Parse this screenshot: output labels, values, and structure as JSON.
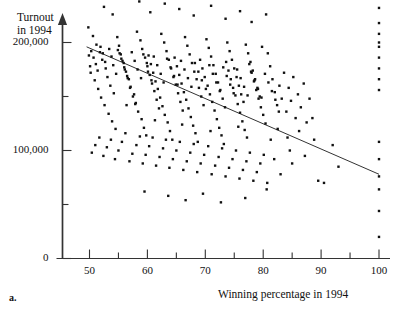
{
  "chart_data": {
    "type": "scatter",
    "title": "",
    "panel_label": "a.",
    "xlabel": "Winning percentage in 1994",
    "ylabel": "Turnout in 1994",
    "ylabel_lines": [
      "Turnout",
      "in 1994"
    ],
    "xlim": [
      45,
      102
    ],
    "ylim": [
      -12000,
      340000
    ],
    "grid": false,
    "legend": null,
    "x_ticks_major": [
      50,
      60,
      70,
      80,
      90,
      100
    ],
    "x_ticks_major_labels": [
      "50",
      "60",
      "70",
      "80",
      "90",
      "100"
    ],
    "x_ticks_minor": [
      55,
      65,
      75,
      85,
      95
    ],
    "y_ticks_major": [
      0,
      100000,
      200000,
      300000
    ],
    "y_ticks_major_labels": [
      "0",
      "100,000",
      "200,000",
      "300,000"
    ],
    "y_ticks_minor": [
      50000,
      150000,
      250000,
      350000
    ],
    "marker": "filled-square-dot",
    "marker_color": "#111111",
    "marker_size_px": 2.4,
    "axis_color": "#333333",
    "trendline": {
      "name": "least-squares regression line",
      "color": "#333333",
      "x_start": 49.5,
      "y_start": 196000,
      "x_end": 100.0,
      "y_end": 78000
    },
    "points": [
      [
        57.2,
        318000
      ],
      [
        70.0,
        295000
      ],
      [
        56.0,
        255000
      ],
      [
        52.5,
        233000
      ],
      [
        54.0,
        226000
      ],
      [
        58.6,
        238000
      ],
      [
        60.5,
        228000
      ],
      [
        63.0,
        236000
      ],
      [
        65.5,
        231000
      ],
      [
        68.0,
        225000
      ],
      [
        71.0,
        234000
      ],
      [
        73.5,
        222000
      ],
      [
        76.0,
        229000
      ],
      [
        78.0,
        219000
      ],
      [
        80.5,
        226000
      ],
      [
        49.8,
        214000
      ],
      [
        50.6,
        206000
      ],
      [
        51.2,
        198000
      ],
      [
        51.8,
        191000
      ],
      [
        52.2,
        184000
      ],
      [
        52.8,
        176000
      ],
      [
        53.1,
        168000
      ],
      [
        53.6,
        160000
      ],
      [
        54.2,
        153000
      ],
      [
        54.8,
        205000
      ],
      [
        55.1,
        197000
      ],
      [
        55.4,
        189000
      ],
      [
        55.9,
        181000
      ],
      [
        56.3,
        173000
      ],
      [
        56.8,
        166000
      ],
      [
        57.0,
        158000
      ],
      [
        57.5,
        150000
      ],
      [
        57.9,
        143000
      ],
      [
        58.2,
        210000
      ],
      [
        58.8,
        202000
      ],
      [
        59.1,
        194000
      ],
      [
        59.6,
        186000
      ],
      [
        60.0,
        178000
      ],
      [
        60.4,
        170000
      ],
      [
        60.8,
        162000
      ],
      [
        61.2,
        155000
      ],
      [
        61.6,
        147000
      ],
      [
        62.0,
        139000
      ],
      [
        62.4,
        208000
      ],
      [
        62.9,
        200000
      ],
      [
        63.3,
        192000
      ],
      [
        63.7,
        184000
      ],
      [
        64.1,
        176000
      ],
      [
        64.5,
        168000
      ],
      [
        64.9,
        161000
      ],
      [
        65.3,
        153000
      ],
      [
        65.7,
        145000
      ],
      [
        66.1,
        137000
      ],
      [
        66.5,
        205000
      ],
      [
        66.9,
        197000
      ],
      [
        67.3,
        189000
      ],
      [
        67.7,
        181000
      ],
      [
        68.1,
        173000
      ],
      [
        68.5,
        166000
      ],
      [
        68.9,
        158000
      ],
      [
        69.3,
        150000
      ],
      [
        69.7,
        142000
      ],
      [
        70.2,
        203000
      ],
      [
        70.6,
        195000
      ],
      [
        71.0,
        187000
      ],
      [
        71.4,
        179000
      ],
      [
        71.8,
        171000
      ],
      [
        72.2,
        163000
      ],
      [
        72.6,
        156000
      ],
      [
        73.0,
        148000
      ],
      [
        73.4,
        140000
      ],
      [
        73.8,
        200000
      ],
      [
        74.2,
        192000
      ],
      [
        74.6,
        184000
      ],
      [
        75.0,
        176000
      ],
      [
        75.4,
        168000
      ],
      [
        75.8,
        160000
      ],
      [
        76.2,
        152000
      ],
      [
        76.6,
        145000
      ],
      [
        77.0,
        198000
      ],
      [
        77.4,
        190000
      ],
      [
        77.8,
        182000
      ],
      [
        78.2,
        174000
      ],
      [
        78.6,
        166000
      ],
      [
        79.0,
        158000
      ],
      [
        79.4,
        150000
      ],
      [
        79.8,
        196000
      ],
      [
        50.2,
        172000
      ],
      [
        50.9,
        165000
      ],
      [
        51.5,
        157000
      ],
      [
        52.0,
        149000
      ],
      [
        52.6,
        142000
      ],
      [
        53.3,
        134000
      ],
      [
        53.9,
        127000
      ],
      [
        54.5,
        120000
      ],
      [
        55.2,
        190000
      ],
      [
        55.7,
        183000
      ],
      [
        56.1,
        175000
      ],
      [
        56.6,
        167000
      ],
      [
        57.1,
        159000
      ],
      [
        57.7,
        152000
      ],
      [
        58.0,
        144000
      ],
      [
        58.4,
        136000
      ],
      [
        59.0,
        129000
      ],
      [
        59.4,
        121000
      ],
      [
        59.8,
        114000
      ],
      [
        60.2,
        188000
      ],
      [
        60.6,
        180000
      ],
      [
        61.0,
        172000
      ],
      [
        61.4,
        164000
      ],
      [
        61.8,
        157000
      ],
      [
        62.2,
        149000
      ],
      [
        62.6,
        141000
      ],
      [
        63.0,
        133000
      ],
      [
        63.5,
        126000
      ],
      [
        63.9,
        118000
      ],
      [
        64.3,
        110000
      ],
      [
        64.7,
        186000
      ],
      [
        65.1,
        178000
      ],
      [
        65.5,
        170000
      ],
      [
        65.9,
        162000
      ],
      [
        66.3,
        154000
      ],
      [
        66.7,
        147000
      ],
      [
        67.1,
        139000
      ],
      [
        67.5,
        131000
      ],
      [
        67.9,
        123000
      ],
      [
        68.3,
        116000
      ],
      [
        68.7,
        108000
      ],
      [
        69.1,
        184000
      ],
      [
        69.5,
        176000
      ],
      [
        69.9,
        168000
      ],
      [
        70.4,
        160000
      ],
      [
        70.8,
        152000
      ],
      [
        71.2,
        145000
      ],
      [
        71.6,
        137000
      ],
      [
        72.0,
        129000
      ],
      [
        72.4,
        121000
      ],
      [
        72.8,
        114000
      ],
      [
        73.2,
        106000
      ],
      [
        73.6,
        182000
      ],
      [
        74.0,
        174000
      ],
      [
        74.4,
        166000
      ],
      [
        74.8,
        158000
      ],
      [
        75.2,
        151000
      ],
      [
        75.6,
        143000
      ],
      [
        76.0,
        135000
      ],
      [
        76.4,
        127000
      ],
      [
        76.8,
        119000
      ],
      [
        77.2,
        112000
      ],
      [
        77.6,
        180000
      ],
      [
        78.0,
        172000
      ],
      [
        78.4,
        164000
      ],
      [
        78.8,
        156000
      ],
      [
        79.2,
        148000
      ],
      [
        79.6,
        140000
      ],
      [
        80.0,
        133000
      ],
      [
        80.4,
        125000
      ],
      [
        80.8,
        190000
      ],
      [
        81.2,
        178000
      ],
      [
        81.6,
        166000
      ],
      [
        82.0,
        154000
      ],
      [
        82.4,
        142000
      ],
      [
        82.8,
        160000
      ],
      [
        83.2,
        148000
      ],
      [
        83.6,
        172000
      ],
      [
        84.0,
        136000
      ],
      [
        84.4,
        158000
      ],
      [
        84.8,
        146000
      ],
      [
        85.2,
        168000
      ],
      [
        85.6,
        130000
      ],
      [
        86.0,
        152000
      ],
      [
        86.5,
        140000
      ],
      [
        87.0,
        162000
      ],
      [
        87.5,
        126000
      ],
      [
        88.0,
        148000
      ],
      [
        50.4,
        98000
      ],
      [
        51.0,
        105000
      ],
      [
        51.7,
        112000
      ],
      [
        52.4,
        95000
      ],
      [
        53.0,
        103000
      ],
      [
        53.7,
        110000
      ],
      [
        54.4,
        92000
      ],
      [
        55.0,
        100000
      ],
      [
        55.6,
        108000
      ],
      [
        56.2,
        116000
      ],
      [
        56.9,
        90000
      ],
      [
        57.4,
        97000
      ],
      [
        58.1,
        105000
      ],
      [
        58.7,
        113000
      ],
      [
        59.2,
        88000
      ],
      [
        59.7,
        96000
      ],
      [
        60.3,
        104000
      ],
      [
        60.9,
        112000
      ],
      [
        61.5,
        86000
      ],
      [
        62.1,
        94000
      ],
      [
        62.7,
        102000
      ],
      [
        63.2,
        110000
      ],
      [
        63.8,
        84000
      ],
      [
        64.4,
        92000
      ],
      [
        65.0,
        100000
      ],
      [
        65.6,
        108000
      ],
      [
        66.2,
        82000
      ],
      [
        66.8,
        90000
      ],
      [
        67.4,
        98000
      ],
      [
        68.0,
        106000
      ],
      [
        68.6,
        80000
      ],
      [
        69.2,
        88000
      ],
      [
        69.8,
        96000
      ],
      [
        70.5,
        104000
      ],
      [
        71.1,
        78000
      ],
      [
        71.7,
        86000
      ],
      [
        72.3,
        94000
      ],
      [
        72.9,
        102000
      ],
      [
        73.5,
        76000
      ],
      [
        74.1,
        84000
      ],
      [
        74.7,
        92000
      ],
      [
        75.3,
        100000
      ],
      [
        75.9,
        74000
      ],
      [
        76.5,
        82000
      ],
      [
        77.1,
        90000
      ],
      [
        77.7,
        98000
      ],
      [
        78.3,
        72000
      ],
      [
        78.9,
        80000
      ],
      [
        79.5,
        88000
      ],
      [
        80.1,
        96000
      ],
      [
        80.7,
        70000
      ],
      [
        81.3,
        110000
      ],
      [
        81.9,
        92000
      ],
      [
        82.5,
        120000
      ],
      [
        83.0,
        78000
      ],
      [
        84.2,
        112000
      ],
      [
        85.0,
        88000
      ],
      [
        86.2,
        118000
      ],
      [
        87.2,
        95000
      ],
      [
        88.5,
        130000
      ],
      [
        89.5,
        72000
      ],
      [
        90.5,
        70000
      ],
      [
        92.0,
        105000
      ],
      [
        93.0,
        85000
      ],
      [
        49.9,
        188000
      ],
      [
        50.1,
        178000
      ],
      [
        50.3,
        192000
      ],
      [
        50.7,
        186000
      ],
      [
        51.1,
        180000
      ],
      [
        51.4,
        174000
      ],
      [
        51.9,
        196000
      ],
      [
        52.3,
        190000
      ],
      [
        52.7,
        182000
      ],
      [
        53.4,
        194000
      ],
      [
        53.8,
        187000
      ],
      [
        54.1,
        179000
      ],
      [
        54.6,
        171000
      ],
      [
        54.9,
        193000
      ],
      [
        55.5,
        185000
      ],
      [
        56.0,
        177000
      ],
      [
        56.5,
        169000
      ],
      [
        57.3,
        191000
      ],
      [
        57.8,
        183000
      ],
      [
        58.3,
        175000
      ],
      [
        58.9,
        167000
      ],
      [
        59.3,
        189000
      ],
      [
        59.9,
        181000
      ],
      [
        60.1,
        173000
      ],
      [
        60.7,
        165000
      ],
      [
        61.1,
        187000
      ],
      [
        61.7,
        179000
      ],
      [
        62.3,
        171000
      ],
      [
        62.8,
        163000
      ],
      [
        63.4,
        185000
      ],
      [
        64.0,
        177000
      ],
      [
        64.6,
        169000
      ],
      [
        65.2,
        161000
      ],
      [
        65.8,
        183000
      ],
      [
        66.4,
        175000
      ],
      [
        67.0,
        167000
      ],
      [
        67.6,
        159000
      ],
      [
        68.2,
        181000
      ],
      [
        68.8,
        173000
      ],
      [
        69.4,
        165000
      ],
      [
        70.1,
        157000
      ],
      [
        70.7,
        179000
      ],
      [
        71.3,
        171000
      ],
      [
        71.9,
        163000
      ],
      [
        72.5,
        155000
      ],
      [
        73.1,
        177000
      ],
      [
        73.7,
        169000
      ],
      [
        74.3,
        161000
      ],
      [
        74.9,
        153000
      ],
      [
        75.5,
        175000
      ],
      [
        76.1,
        167000
      ],
      [
        76.7,
        159000
      ],
      [
        77.3,
        151000
      ],
      [
        77.9,
        173000
      ],
      [
        78.5,
        165000
      ],
      [
        79.1,
        157000
      ],
      [
        79.7,
        149000
      ],
      [
        80.3,
        171000
      ],
      [
        80.9,
        163000
      ],
      [
        81.5,
        155000
      ],
      [
        82.1,
        147000
      ],
      [
        56.4,
        142000
      ],
      [
        61.3,
        128000
      ],
      [
        66.0,
        124000
      ],
      [
        70.9,
        118000
      ],
      [
        75.7,
        122000
      ],
      [
        82.7,
        136000
      ],
      [
        63.6,
        58000
      ],
      [
        66.6,
        54000
      ],
      [
        69.6,
        60000
      ],
      [
        72.7,
        52000
      ],
      [
        59.5,
        62000
      ],
      [
        76.9,
        56000
      ],
      [
        80.6,
        64000
      ],
      [
        84.6,
        100000
      ],
      [
        88.8,
        110000
      ],
      [
        100.0,
        232000
      ],
      [
        100.0,
        218000
      ],
      [
        100.0,
        208000
      ],
      [
        100.0,
        200000
      ],
      [
        100.0,
        196000
      ],
      [
        100.0,
        186000
      ],
      [
        100.0,
        176000
      ],
      [
        100.0,
        166000
      ],
      [
        100.0,
        156000
      ],
      [
        100.0,
        108000
      ],
      [
        100.0,
        92000
      ],
      [
        100.0,
        76000
      ],
      [
        100.0,
        64000
      ],
      [
        100.0,
        44000
      ],
      [
        100.0,
        20000
      ]
    ]
  }
}
